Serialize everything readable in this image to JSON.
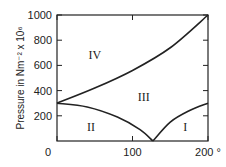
{
  "chart_data": {
    "type": "line",
    "title": "",
    "xlabel": "",
    "x_unit": "°",
    "ylabel": "Pressure in Nm⁻² x 10⁶",
    "xlim": [
      0,
      200
    ],
    "ylim": [
      0,
      1000
    ],
    "x_ticks": [
      "0",
      "100",
      "200"
    ],
    "y_ticks": [
      "200",
      "400",
      "600",
      "800",
      "1000"
    ],
    "grid": false,
    "series": [
      {
        "name": "IV/III boundary",
        "x": [
          0,
          50,
          100,
          150,
          200
        ],
        "y": [
          300,
          420,
          560,
          740,
          1000
        ]
      },
      {
        "name": "III/II boundary",
        "x": [
          0,
          40,
          80,
          110,
          127
        ],
        "y": [
          300,
          270,
          190,
          90,
          0
        ]
      },
      {
        "name": "III/I boundary",
        "x": [
          127,
          150,
          175,
          200
        ],
        "y": [
          0,
          150,
          240,
          300
        ]
      }
    ],
    "annotations": [
      {
        "text": "IV",
        "x": 50,
        "y": 680
      },
      {
        "text": "III",
        "x": 115,
        "y": 350
      },
      {
        "text": "II",
        "x": 45,
        "y": 110
      },
      {
        "text": "I",
        "x": 170,
        "y": 110
      }
    ]
  }
}
